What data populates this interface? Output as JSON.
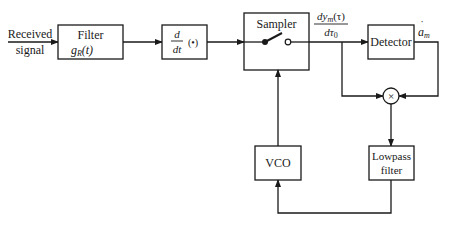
{
  "diagram": {
    "input_label_line1": "Received",
    "input_label_line2": "signal",
    "blocks": {
      "filter": {
        "title": "Filter",
        "sub": "g",
        "sub_index": "R",
        "sub_arg": "(t)"
      },
      "differentiator": {
        "num": "d",
        "den": "dt",
        "arg": "(•)"
      },
      "sampler": {
        "title": "Sampler"
      },
      "detector": {
        "title": "Detector"
      },
      "multiplier": {
        "symbol": "×"
      },
      "vco": {
        "title": "VCO"
      },
      "lowpass": {
        "line1": "Lowpass",
        "line2": "filter"
      }
    },
    "sampler_output": {
      "num_pre": "dy",
      "num_index": "m",
      "num_arg": "(τ)",
      "den_pre": "dτ",
      "den_index": "0"
    },
    "detector_output": {
      "symbol": "a",
      "index": "m",
      "accent": "˙"
    }
  }
}
